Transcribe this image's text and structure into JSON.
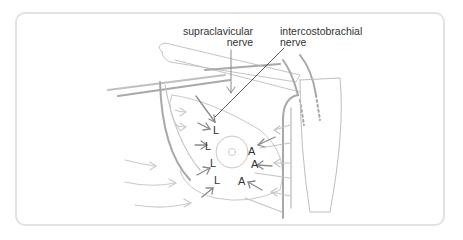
{
  "diagram": {
    "labels": {
      "supraclavicular_line1": "supraclavicular",
      "supraclavicular_line2": "nerve",
      "intercostobrachial_line1": "intercostobrachial",
      "intercostobrachial_line2": "nerve"
    },
    "markers": {
      "lateral": [
        "L",
        "L",
        "L",
        "L"
      ],
      "anterior": [
        "A",
        "A",
        "A"
      ]
    },
    "colors": {
      "frame": "#e2e2e2",
      "structure": "#b8b8b8",
      "arrow_light": "#c9c9c9",
      "arrow_dark": "#8a8a8a",
      "text": "#333333"
    }
  }
}
